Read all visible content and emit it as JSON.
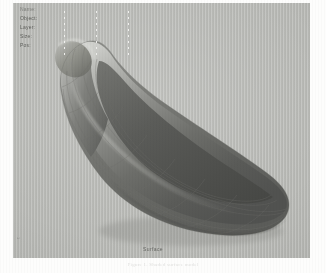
{
  "application": {
    "viewport_background": "#b9bab6",
    "page_background": "#fdfdfc"
  },
  "labels": {
    "items": [
      {
        "text": "Name:"
      },
      {
        "text": "Object:"
      },
      {
        "text": "Layer:"
      },
      {
        "text": "Size:"
      },
      {
        "text": "Pos:"
      }
    ]
  },
  "guides": {
    "line_1_label": "guide-1",
    "line_2_label": "guide-2",
    "line_3_label": "guide-3"
  },
  "status": {
    "text": "Surface"
  },
  "edge": {
    "marker": "1"
  },
  "caption": {
    "text": "Figure 1.  Shaded surface model"
  },
  "model": {
    "name": "nurbs-surface-model",
    "shading": {
      "highlight": "#c9cac6",
      "midtone": "#8b8c88",
      "shadow": "#5d5e5b",
      "deep_shadow": "#4a4b48",
      "rim_light": "#d6d7d3"
    },
    "isoparm_color": "#6b6c68"
  }
}
